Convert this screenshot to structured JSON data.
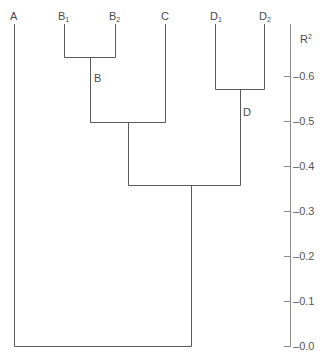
{
  "diagram": {
    "type": "dendrogram",
    "axis": {
      "label": "R",
      "label_sup": "2",
      "ticks": [
        "0.6",
        "0.5",
        "0.4",
        "0.3",
        "0.2",
        "0.1",
        "0.0"
      ]
    },
    "leaves": [
      {
        "name": "A",
        "sub": ""
      },
      {
        "name": "B",
        "sub": "1"
      },
      {
        "name": "B",
        "sub": "2"
      },
      {
        "name": "C",
        "sub": ""
      },
      {
        "name": "D",
        "sub": "1"
      },
      {
        "name": "D",
        "sub": "2"
      }
    ],
    "cluster_labels": {
      "b": "B",
      "d": "D"
    },
    "merges": [
      {
        "nodes": [
          "B1",
          "B2"
        ],
        "r2": 0.64,
        "label": "B"
      },
      {
        "nodes": [
          "D1",
          "D2"
        ],
        "r2": 0.57,
        "label": "D"
      },
      {
        "nodes": [
          "B",
          "C"
        ],
        "r2": 0.5
      },
      {
        "nodes": [
          "BC",
          "D"
        ],
        "r2": 0.36
      },
      {
        "nodes": [
          "A",
          "BCD"
        ],
        "r2": 0.0
      }
    ]
  }
}
